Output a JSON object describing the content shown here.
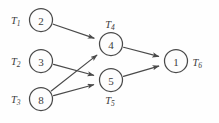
{
  "diagram": {
    "style": {
      "background": "#fefefe",
      "stroke": "#4a4a4a",
      "text": "#3c3c3c"
    }
  },
  "chart_data": {
    "type": "diagram",
    "graph_kind": "directed-acyclic-graph",
    "nodes": [
      {
        "id": "T1",
        "task": "T",
        "subscript": "1",
        "value": "2",
        "cx": 41,
        "cy": 20,
        "r": 11.5,
        "label_pos": "left"
      },
      {
        "id": "T2",
        "task": "T",
        "subscript": "2",
        "value": "3",
        "cx": 41,
        "cy": 61,
        "r": 11.5,
        "label_pos": "left"
      },
      {
        "id": "T3",
        "task": "T",
        "subscript": "3",
        "value": "8",
        "cx": 41,
        "cy": 99,
        "r": 11.5,
        "label_pos": "left"
      },
      {
        "id": "T4",
        "task": "T",
        "subscript": "4",
        "value": "4",
        "cx": 111,
        "cy": 44,
        "r": 11.5,
        "label_pos": "above"
      },
      {
        "id": "T5",
        "task": "T",
        "subscript": "5",
        "value": "5",
        "cx": 111,
        "cy": 80,
        "r": 11.5,
        "label_pos": "below"
      },
      {
        "id": "T6",
        "task": "T",
        "subscript": "6",
        "value": "1",
        "cx": 176,
        "cy": 61,
        "r": 11.5,
        "label_pos": "right"
      }
    ],
    "edges": [
      {
        "from": "T1",
        "to": "T4"
      },
      {
        "from": "T2",
        "to": "T5"
      },
      {
        "from": "T3",
        "to": "T4"
      },
      {
        "from": "T3",
        "to": "T5"
      },
      {
        "from": "T4",
        "to": "T6"
      },
      {
        "from": "T5",
        "to": "T6"
      }
    ],
    "labels": {
      "T1": "T1",
      "T2": "T2",
      "T3": "T3",
      "T4": "T4",
      "T5": "T5",
      "T6": "T6"
    },
    "values": {
      "T1": 2,
      "T2": 3,
      "T3": 8,
      "T4": 4,
      "T5": 5,
      "T6": 1
    }
  }
}
